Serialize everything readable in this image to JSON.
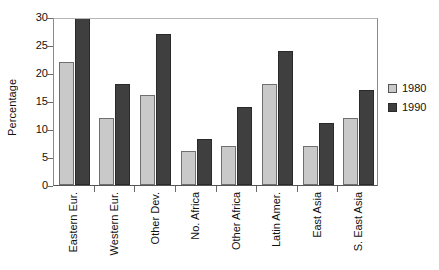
{
  "chart_data": {
    "type": "bar",
    "title": "",
    "subtitle": "",
    "xlabel": "",
    "ylabel": "Percentage",
    "ylim": [
      0,
      30
    ],
    "yticks": [
      0,
      5,
      10,
      15,
      20,
      25,
      30
    ],
    "ytick_labels": [
      "0",
      "5",
      "10",
      "15",
      "20",
      "25",
      "30"
    ],
    "grid": false,
    "legend_position": "right",
    "categories": [
      "Eastern Eur.",
      "Western Eur.",
      "Other Dev.",
      "No. Africa",
      "Other Africa",
      "Latin Amer.",
      "East Asia",
      "S. East Asia"
    ],
    "series": [
      {
        "name": "1980",
        "color": "#c9c9c9",
        "values": [
          22,
          12,
          16,
          6,
          7,
          18,
          7,
          12
        ]
      },
      {
        "name": "1990",
        "color": "#3f3f3f",
        "values": [
          30,
          18,
          27,
          8.3,
          14,
          24,
          11,
          17
        ]
      }
    ],
    "annotations": [
      "Eastern Eur. 1990 bar reaches the top of the axis at 30 and is clipped by the plot frame."
    ]
  }
}
